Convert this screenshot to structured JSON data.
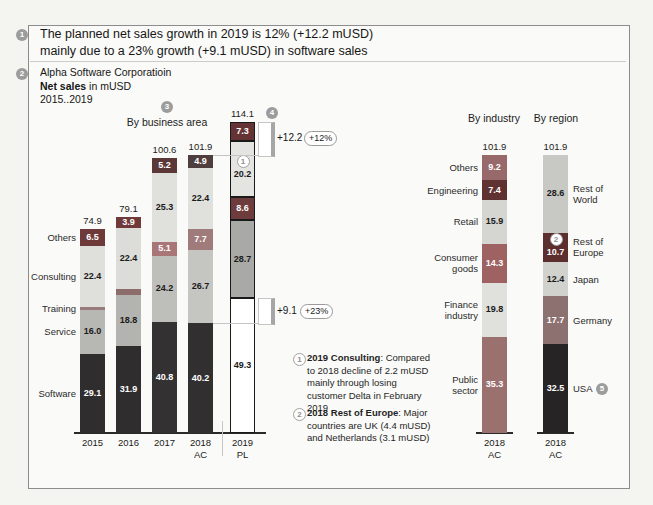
{
  "message": {
    "badge": "1",
    "line1": "The planned net sales growth in 2019 is 12% (+12.2 mUSD)",
    "line2": "mainly due to a 23% growth (+9.1 mUSD) in software sales"
  },
  "header": {
    "badge": "2",
    "company": "Alpha Software Corporatioin",
    "metric_bold": "Net sales",
    "metric_rest": " in mUSD",
    "period": "2015..2019"
  },
  "colors": {
    "software_dark": "#2f2d2d",
    "highlight_maroon": "#5c2e2e",
    "plan_outline": "#1a1a1a",
    "badge_gray": "#9c9c9c",
    "bracket_gray": "#a6a6a6"
  },
  "chart_data": [
    {
      "type": "bar",
      "stacked": true,
      "title": "By business area",
      "title_badge": "3",
      "unit": "mUSD",
      "ylim": [
        0,
        120
      ],
      "categories": [
        "2015",
        "2016",
        "2017",
        "2018|AC",
        "2019|PL"
      ],
      "totals": [
        74.9,
        79.1,
        100.6,
        101.9,
        114.1
      ],
      "total_badge": {
        "text": "4",
        "on_category": "2019|PL"
      },
      "plan_column": 4,
      "series": [
        {
          "name": "Software",
          "values": [
            29.1,
            31.9,
            40.8,
            40.2,
            49.3
          ],
          "colors": [
            "#2f2d2d",
            "#2f2d2d",
            "#333131",
            "#312f2f",
            "#ffffff"
          ],
          "text_colors": [
            "#ffffff",
            "#ffffff",
            "#ffffff",
            "#ffffff",
            "#1a1a1a"
          ]
        },
        {
          "name": "Service",
          "values": [
            16.0,
            18.8,
            24.2,
            26.7,
            28.7
          ],
          "colors": [
            "#b7b7b4",
            "#b3b3b0",
            "#bebebb",
            "#c5c5c2",
            "#a9a9a6"
          ],
          "text_colors": [
            "#1a1a1a",
            "#1a1a1a",
            "#1a1a1a",
            "#1a1a1a",
            "#1a1a1a"
          ]
        },
        {
          "name": "Training",
          "values": [
            0.9,
            2.1,
            5.1,
            7.7,
            8.6
          ],
          "colors": [
            "#9a7b7b",
            "#8d6c6c",
            "#a87676",
            "#9f7b7b",
            "#6e3c3c"
          ],
          "text_colors": [
            "#ffffff",
            "#ffffff",
            "#ffffff",
            "#ffffff",
            "#ffffff"
          ]
        },
        {
          "name": "Consulting",
          "values": [
            22.4,
            22.4,
            25.3,
            22.4,
            20.2
          ],
          "colors": [
            "#dfdfdc",
            "#dcdcd9",
            "#e0e0dd",
            "#e0e0dd",
            "#e4e4e1"
          ],
          "text_colors": [
            "#1a1a1a",
            "#1a1a1a",
            "#1a1a1a",
            "#1a1a1a",
            "#1a1a1a"
          ],
          "value_badge": {
            "text": "1",
            "column": 4
          }
        },
        {
          "name": "Others",
          "values": [
            6.5,
            3.9,
            5.2,
            4.9,
            7.3
          ],
          "colors": [
            "#6e3939",
            "#703a3a",
            "#5c3737",
            "#4f3e3e",
            "#643434"
          ],
          "text_colors": [
            "#ffffff",
            "#ffffff",
            "#ffffff",
            "#ffffff",
            "#ffffff"
          ]
        }
      ],
      "annotations": {
        "growth_total": {
          "label": "+12.2",
          "pct": "+12%"
        },
        "growth_software": {
          "label": "+9.1",
          "pct": "+23%"
        }
      }
    },
    {
      "type": "bar",
      "stacked": true,
      "title": "By industry",
      "unit": "mUSD",
      "ylim": [
        0,
        120
      ],
      "categories": [
        "2018|AC"
      ],
      "totals": [
        101.9
      ],
      "label_side": "left",
      "series": [
        {
          "name": "Public|sector",
          "values": [
            35.3
          ],
          "colors": [
            "#9b7170"
          ],
          "text_colors": [
            "#ffffff"
          ]
        },
        {
          "name": "Finance|industry",
          "values": [
            19.8
          ],
          "colors": [
            "#e0e0dc"
          ],
          "text_colors": [
            "#1a1a1a"
          ]
        },
        {
          "name": "Consumer|goods",
          "values": [
            14.3
          ],
          "colors": [
            "#9e6262"
          ],
          "text_colors": [
            "#ffffff"
          ]
        },
        {
          "name": "Retail",
          "values": [
            15.9
          ],
          "colors": [
            "#d5d5d2"
          ],
          "text_colors": [
            "#1a1a1a"
          ]
        },
        {
          "name": "Engineering",
          "values": [
            7.4
          ],
          "colors": [
            "#5f3131"
          ],
          "text_colors": [
            "#ffffff"
          ]
        },
        {
          "name": "Others",
          "values": [
            9.2
          ],
          "colors": [
            "#97696a"
          ],
          "text_colors": [
            "#ffffff"
          ]
        }
      ]
    },
    {
      "type": "bar",
      "stacked": true,
      "title": "By region",
      "unit": "mUSD",
      "ylim": [
        0,
        120
      ],
      "categories": [
        "2018|AC"
      ],
      "totals": [
        101.9
      ],
      "label_side": "right",
      "series": [
        {
          "name": "USA",
          "values": [
            32.5
          ],
          "colors": [
            "#262424"
          ],
          "text_colors": [
            "#ffffff"
          ],
          "label_badge": "5"
        },
        {
          "name": "Germany",
          "values": [
            17.7
          ],
          "colors": [
            "#8d7171"
          ],
          "text_colors": [
            "#ffffff"
          ]
        },
        {
          "name": "Japan",
          "values": [
            12.4
          ],
          "colors": [
            "#d1d1ce"
          ],
          "text_colors": [
            "#1a1a1a"
          ]
        },
        {
          "name": "Rest of|Europe",
          "values": [
            10.7
          ],
          "colors": [
            "#5c2e2e"
          ],
          "text_colors": [
            "#ffffff"
          ],
          "value_badge": {
            "text": "2",
            "column": 0
          }
        },
        {
          "name": "Rest of|World",
          "values": [
            28.6
          ],
          "colors": [
            "#c8c8c5"
          ],
          "text_colors": [
            "#1a1a1a"
          ]
        }
      ]
    }
  ],
  "footnotes": [
    {
      "badge": "1",
      "bold": "2019 Consulting",
      "rest": ": Compared to 2018 decline of 2.2 mUSD mainly through losing customer Delta in February 2019"
    },
    {
      "badge": "2",
      "bold": "2018 Rest of Europe",
      "rest": ": Major countries are UK (4.4 mUSD) and Netherlands (3.1 mUSD)"
    }
  ]
}
